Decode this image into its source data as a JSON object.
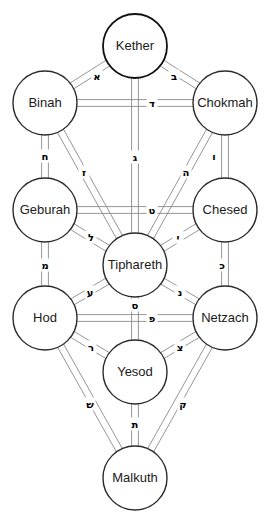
{
  "diagram": {
    "type": "kabbalistic-tree-diagram",
    "width": 270,
    "height": 527,
    "background_color": "#ffffff",
    "circle_stroke_color": "#2b2b2b",
    "path_stroke_color": "#8a8a8a",
    "text_color": "#1a1a1a",
    "circle_radius": 32
  },
  "sephiroth": [
    {
      "id": "kether",
      "label": "Kether",
      "cx": 135,
      "cy": 46,
      "r": 32,
      "accent": true
    },
    {
      "id": "binah",
      "label": "Binah",
      "cx": 45,
      "cy": 103,
      "r": 32,
      "accent": false
    },
    {
      "id": "chokmah",
      "label": "Chokmah",
      "cx": 225,
      "cy": 103,
      "r": 32,
      "accent": false
    },
    {
      "id": "geburah",
      "label": "Geburah",
      "cx": 45,
      "cy": 210,
      "r": 32,
      "accent": false
    },
    {
      "id": "chesed",
      "label": "Chesed",
      "cx": 225,
      "cy": 210,
      "r": 32,
      "accent": false
    },
    {
      "id": "tiphareth",
      "label": "Tiphareth",
      "cx": 135,
      "cy": 265,
      "r": 32,
      "accent": false
    },
    {
      "id": "hod",
      "label": "Hod",
      "cx": 45,
      "cy": 318,
      "r": 32,
      "accent": false
    },
    {
      "id": "netzach",
      "label": "Netzach",
      "cx": 225,
      "cy": 318,
      "r": 32,
      "accent": false
    },
    {
      "id": "yesod",
      "label": "Yesod",
      "cx": 135,
      "cy": 372,
      "r": 32,
      "accent": false
    },
    {
      "id": "malkuth",
      "label": "Malkuth",
      "cx": 135,
      "cy": 478,
      "r": 32,
      "accent": false
    }
  ],
  "paths": [
    {
      "id": "path-aleph",
      "letter": "א",
      "name": "aleph",
      "from": "kether",
      "to": "binah",
      "lx": 97,
      "ly": 76
    },
    {
      "id": "path-beth",
      "letter": "ב",
      "name": "beth",
      "from": "kether",
      "to": "chokmah",
      "lx": 174,
      "ly": 76
    },
    {
      "id": "path-gimel",
      "letter": "ג",
      "name": "gimel",
      "from": "kether",
      "to": "tiphareth",
      "lx": 135,
      "ly": 157
    },
    {
      "id": "path-daleth",
      "letter": "ד",
      "name": "daleth",
      "from": "binah",
      "to": "chokmah",
      "lx": 152,
      "ly": 103
    },
    {
      "id": "path-he",
      "letter": "ה",
      "name": "he",
      "from": "chokmah",
      "to": "tiphareth",
      "lx": 186,
      "ly": 172
    },
    {
      "id": "path-vav",
      "letter": "ו",
      "name": "vav",
      "from": "chokmah",
      "to": "chesed",
      "lx": 214,
      "ly": 156
    },
    {
      "id": "path-zayin",
      "letter": "ז",
      "name": "zayin",
      "from": "binah",
      "to": "tiphareth",
      "lx": 84,
      "ly": 172
    },
    {
      "id": "path-cheth",
      "letter": "ח",
      "name": "cheth",
      "from": "binah",
      "to": "geburah",
      "lx": 45,
      "ly": 156
    },
    {
      "id": "path-teth",
      "letter": "ט",
      "name": "teth",
      "from": "geburah",
      "to": "chesed",
      "lx": 152,
      "ly": 210
    },
    {
      "id": "path-yod",
      "letter": "י",
      "name": "yod",
      "from": "chesed",
      "to": "tiphareth",
      "lx": 178,
      "ly": 237
    },
    {
      "id": "path-kaph",
      "letter": "כ",
      "name": "kaph",
      "from": "chesed",
      "to": "netzach",
      "lx": 222,
      "ly": 265
    },
    {
      "id": "path-lamed",
      "letter": "ל",
      "name": "lamed",
      "from": "geburah",
      "to": "tiphareth",
      "lx": 91,
      "ly": 237
    },
    {
      "id": "path-mem",
      "letter": "מ",
      "name": "mem",
      "from": "geburah",
      "to": "hod",
      "lx": 45,
      "ly": 265
    },
    {
      "id": "path-nun",
      "letter": "נ",
      "name": "nun",
      "from": "tiphareth",
      "to": "netzach",
      "lx": 180,
      "ly": 292
    },
    {
      "id": "path-samekh",
      "letter": "ס",
      "name": "samekh",
      "from": "tiphareth",
      "to": "yesod",
      "lx": 135,
      "ly": 305
    },
    {
      "id": "path-ayin",
      "letter": "ע",
      "name": "ayin",
      "from": "tiphareth",
      "to": "hod",
      "lx": 90,
      "ly": 292
    },
    {
      "id": "path-pe",
      "letter": "פ",
      "name": "pe",
      "from": "hod",
      "to": "netzach",
      "lx": 152,
      "ly": 318
    },
    {
      "id": "path-tzaddi",
      "letter": "צ",
      "name": "tzaddi",
      "from": "netzach",
      "to": "yesod",
      "lx": 180,
      "ly": 347
    },
    {
      "id": "path-qoph",
      "letter": "ק",
      "name": "qoph",
      "from": "netzach",
      "to": "malkuth",
      "lx": 183,
      "ly": 404
    },
    {
      "id": "path-resh",
      "letter": "ר",
      "name": "resh",
      "from": "hod",
      "to": "yesod",
      "lx": 91,
      "ly": 347
    },
    {
      "id": "path-shin",
      "letter": "ש",
      "name": "shin",
      "from": "hod",
      "to": "malkuth",
      "lx": 90,
      "ly": 404
    },
    {
      "id": "path-tav",
      "letter": "ת",
      "name": "tav",
      "from": "yesod",
      "to": "malkuth",
      "lx": 135,
      "ly": 424
    }
  ]
}
